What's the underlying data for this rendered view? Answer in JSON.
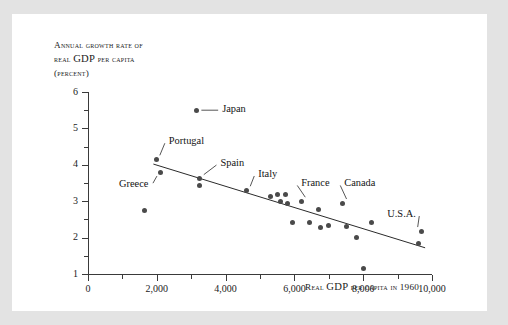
{
  "panel": {
    "background": "#ffffff",
    "page_background": "#e3e3e3"
  },
  "chart_data": {
    "type": "scatter",
    "title": "",
    "ylabel_lines": [
      "Annual growth rate of",
      "real GDP per capita",
      "(percent)"
    ],
    "ylabel_line1": "Annual growth rate of",
    "ylabel_line2_pre": "real ",
    "ylabel_line2_big": "GDP",
    "ylabel_line2_post": " per capita",
    "ylabel_line3": "(percent)",
    "xlabel_pre": "Real ",
    "xlabel_big": "GDP",
    "xlabel_post": " per capita in 1960",
    "xlabel": "Real GDP per capita in 1960",
    "xlim": [
      0,
      10000
    ],
    "ylim": [
      1,
      6
    ],
    "xticks_major": [
      0,
      2000,
      4000,
      6000,
      8000,
      10000
    ],
    "xticks_major_labels": [
      "0",
      "2,000",
      "4,000",
      "6,000",
      "8,000",
      "10,000"
    ],
    "xticks_minor": [
      1000,
      3000,
      5000,
      7000,
      9000
    ],
    "yticks_major": [
      1,
      2,
      3,
      4,
      5,
      6
    ],
    "yticks_major_labels": [
      "1",
      "2",
      "3",
      "4",
      "5",
      "6"
    ],
    "yticks_minor": [
      1.5,
      2.5,
      3.5,
      4.5,
      5.5
    ],
    "grid": false,
    "legend": "none",
    "marker_color": "#4a4a4a",
    "line_color": "#2b2b2b",
    "trendline": {
      "x": [
        1900,
        9800
      ],
      "y": [
        4.02,
        1.72
      ]
    },
    "points": [
      {
        "x": 1650,
        "y": 2.75,
        "label": ""
      },
      {
        "x": 2000,
        "y": 4.15,
        "label": "Portugal"
      },
      {
        "x": 2120,
        "y": 3.8,
        "label": "Greece"
      },
      {
        "x": 3150,
        "y": 5.5,
        "label": "Japan"
      },
      {
        "x": 3250,
        "y": 3.62,
        "label": "Spain"
      },
      {
        "x": 3250,
        "y": 3.42,
        "label": ""
      },
      {
        "x": 4600,
        "y": 3.3,
        "label": "Italy"
      },
      {
        "x": 5300,
        "y": 3.12,
        "label": ""
      },
      {
        "x": 5500,
        "y": 3.18,
        "label": ""
      },
      {
        "x": 5600,
        "y": 2.98,
        "label": ""
      },
      {
        "x": 5750,
        "y": 3.18,
        "label": ""
      },
      {
        "x": 5800,
        "y": 2.95,
        "label": ""
      },
      {
        "x": 5950,
        "y": 2.42,
        "label": ""
      },
      {
        "x": 6200,
        "y": 3.0,
        "label": "France"
      },
      {
        "x": 6450,
        "y": 2.42,
        "label": ""
      },
      {
        "x": 6700,
        "y": 2.78,
        "label": ""
      },
      {
        "x": 6750,
        "y": 2.28,
        "label": ""
      },
      {
        "x": 7000,
        "y": 2.32,
        "label": ""
      },
      {
        "x": 7400,
        "y": 2.95,
        "label": "Canada"
      },
      {
        "x": 7500,
        "y": 2.3,
        "label": ""
      },
      {
        "x": 7800,
        "y": 2.0,
        "label": ""
      },
      {
        "x": 8000,
        "y": 1.15,
        "label": ""
      },
      {
        "x": 8250,
        "y": 2.42,
        "label": ""
      },
      {
        "x": 9600,
        "y": 1.85,
        "label": ""
      },
      {
        "x": 9700,
        "y": 2.18,
        "label": "U.S.A."
      }
    ],
    "annotations": [
      {
        "text": "Japan",
        "tx": 3900,
        "ty": 5.5
      },
      {
        "text": "Portugal",
        "tx": 2350,
        "ty": 4.62
      },
      {
        "text": "Greece",
        "tx": 900,
        "ty": 3.44
      },
      {
        "text": "Spain",
        "tx": 3850,
        "ty": 4.02
      },
      {
        "text": "Italy",
        "tx": 4950,
        "ty": 3.72
      },
      {
        "text": "France",
        "tx": 6200,
        "ty": 3.46
      },
      {
        "text": "Canada",
        "tx": 7450,
        "ty": 3.46
      },
      {
        "text": "U.S.A.",
        "tx": 8700,
        "ty": 2.62
      }
    ]
  }
}
